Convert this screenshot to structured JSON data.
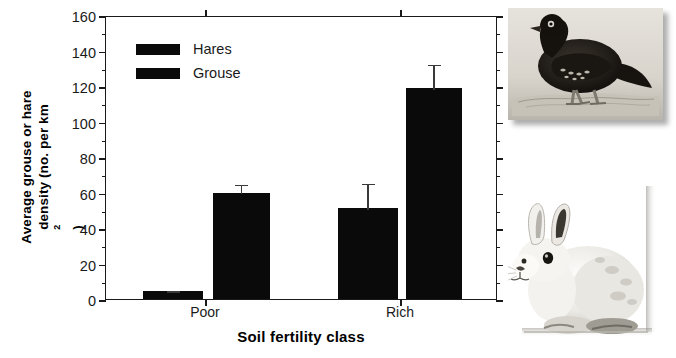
{
  "chart_data": {
    "type": "bar",
    "title": "",
    "xlabel": "Soil fertility class",
    "ylabel_line1": "Average grouse or hare",
    "ylabel_line2_pre": "density (no. per km",
    "ylabel_line2_sup": "2",
    "ylabel_line2_post": ")",
    "ylabel_full": "Average grouse or hare density (no. per km2)",
    "categories": [
      "Poor",
      "Rich"
    ],
    "series": [
      {
        "name": "Hares",
        "values": [
          4.5,
          51
        ],
        "errors": [
          1,
          15
        ]
      },
      {
        "name": "Grouse",
        "values": [
          60,
          119
        ],
        "errors": [
          5.5,
          14
        ]
      }
    ],
    "ylim": [
      0,
      160
    ],
    "yticks": [
      0,
      20,
      40,
      60,
      80,
      100,
      120,
      140,
      160
    ],
    "ytick_labels": [
      "0",
      "20",
      "40",
      "60",
      "80",
      "100",
      "120",
      "140",
      "160"
    ],
    "yminor_ticks": [
      10,
      30,
      50,
      70,
      90,
      110,
      130,
      150
    ],
    "grid": false,
    "legend_position": "top-left",
    "bar_color": "#0a0a0a",
    "axis_color": "#1a1a1a"
  },
  "legend": {
    "entries": [
      {
        "label": "Hares",
        "swatch_color": "#0a0a0a"
      },
      {
        "label": "Grouse",
        "swatch_color": "#0a0a0a"
      }
    ]
  },
  "photos": [
    {
      "name": "grouse-photo",
      "caption": "grouse illustration"
    },
    {
      "name": "hare-photo",
      "caption": "snowshoe hare photograph"
    }
  ]
}
